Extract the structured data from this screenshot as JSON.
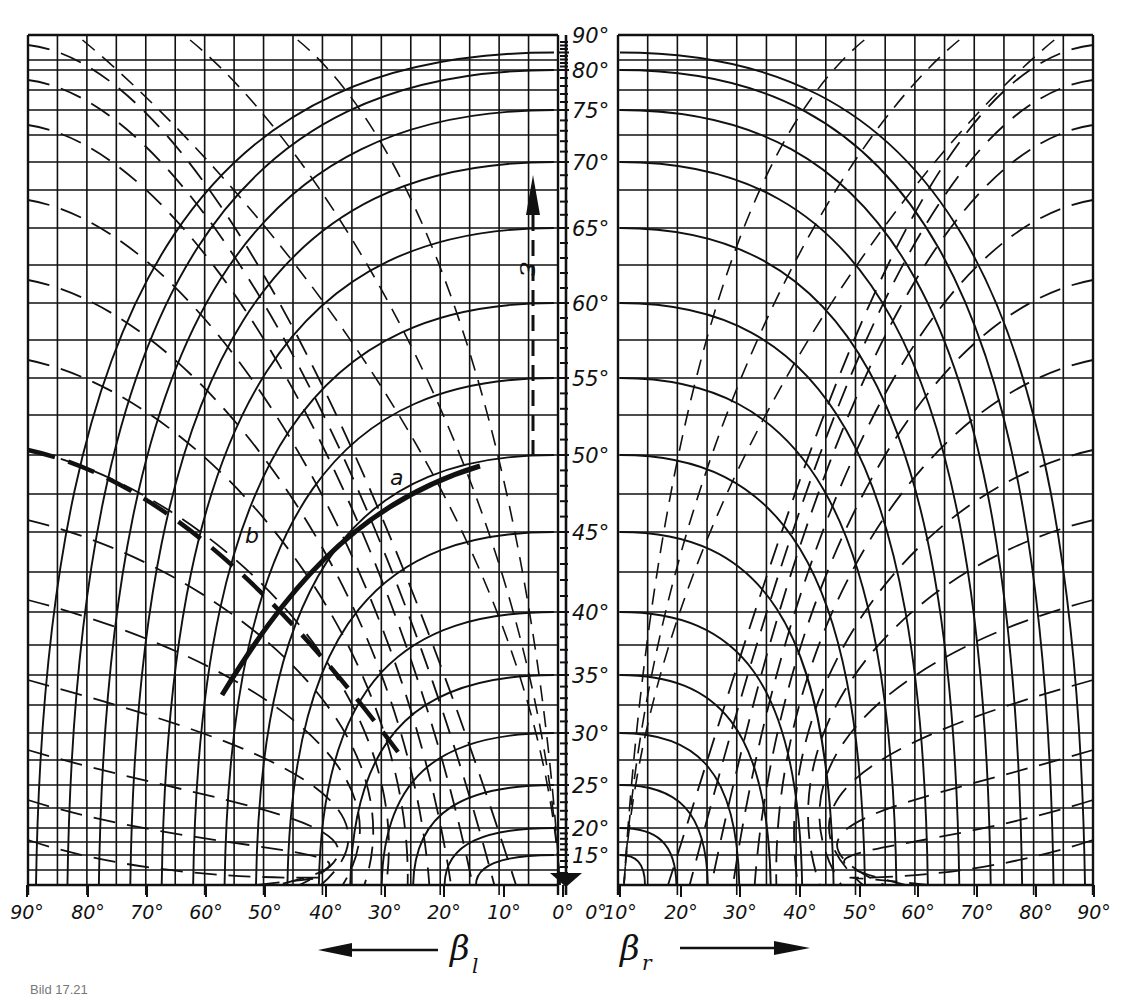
{
  "figure": {
    "caption": "Bild 17.21"
  },
  "axes": {
    "vertical": {
      "symbol": "ε",
      "tick_labels": [
        "90°",
        "80°",
        "75°",
        "70°",
        "65°",
        "60°",
        "55°",
        "50°",
        "45°",
        "40°",
        "35°",
        "30°",
        "25°",
        "20°",
        "15°"
      ]
    },
    "left": {
      "symbol": "β",
      "subscript": "l",
      "direction": "left",
      "tick_labels": [
        "90°",
        "80°",
        "70°",
        "60°",
        "50°",
        "40°",
        "30°",
        "20°",
        "10°",
        "0°"
      ]
    },
    "right": {
      "symbol": "β",
      "subscript": "r",
      "direction": "right",
      "tick_labels": [
        "0°",
        "10°",
        "20°",
        "30°",
        "40°",
        "50°",
        "60°",
        "70°",
        "80°",
        "90°"
      ]
    }
  },
  "annotations": {
    "curve_a": "a",
    "curve_b": "b"
  },
  "chart_data": {
    "type": "nomogram",
    "title": "",
    "caption": "Bild 17.21",
    "xlabel_left": "β_l (increasing to the left)",
    "xlabel_right": "β_r (increasing to the right)",
    "ylabel": "ε",
    "x_ticks_left": [
      90,
      80,
      70,
      60,
      50,
      40,
      30,
      20,
      10,
      0
    ],
    "x_ticks_right": [
      0,
      10,
      20,
      30,
      40,
      50,
      60,
      70,
      80,
      90
    ],
    "y_ticks": [
      15,
      20,
      25,
      30,
      35,
      40,
      45,
      50,
      55,
      60,
      65,
      70,
      75,
      80,
      90
    ],
    "y_scale": "non-linear (stretched toward 45°)",
    "grid": true,
    "series": [
      {
        "name": "solid curve family (constant ε, left panel)",
        "style": "solid",
        "values_eps": [
          15,
          20,
          25,
          30,
          35,
          40,
          45,
          50,
          55,
          60,
          65,
          70,
          75,
          80,
          85
        ]
      },
      {
        "name": "dashed curve family (left panel)",
        "style": "dashed",
        "values_count": 16
      },
      {
        "name": "solid curve family (right panel)",
        "style": "solid",
        "values_eps": [
          15,
          20,
          25,
          30,
          35,
          40,
          45,
          50,
          55,
          60,
          65,
          70,
          75,
          80,
          85
        ]
      },
      {
        "name": "dashed curve family (right panel)",
        "style": "dashed",
        "values_count": 16
      },
      {
        "name": "a",
        "style": "bold solid",
        "description": "highlighted ε = 50° curve from β_l≈57° to β_l≈15°"
      },
      {
        "name": "b",
        "style": "bold dashed",
        "description": "highlighted dashed curve from β_l≈90° (ε≈50°) to β_l≈28° (ε≈29°)"
      }
    ]
  }
}
